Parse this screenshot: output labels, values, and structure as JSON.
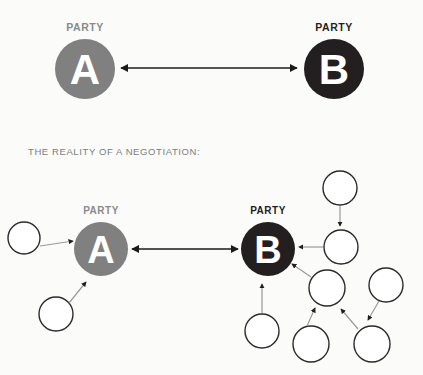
{
  "canvas": {
    "width": 423,
    "height": 375,
    "background": "#fbfbfa"
  },
  "caption": {
    "text": "THE REALITY OF A NEGOTIATION:",
    "color": "#7d7d7d",
    "x": 28,
    "y": 155,
    "font_size": 9.5
  },
  "colors": {
    "party_a_fill": "#808080",
    "party_a_label": "#8a8a8a",
    "party_b_fill": "#231f20",
    "party_b_label": "#231f20",
    "letter_fill": "#ffffff",
    "satellite_fill": "#ffffff",
    "satellite_stroke": "#2b2b2b",
    "arrow_dark": "#1a1a1a",
    "arrow_light": "#8f8f8f"
  },
  "diagram_top": {
    "name": "ideal-negotiation",
    "party_a": {
      "label": "PARTY",
      "letter": "A",
      "cx": 85,
      "cy": 69,
      "r": 30,
      "label_x": 85,
      "label_y": 31,
      "fill": "#808080",
      "label_color": "#8a8a8a"
    },
    "party_b": {
      "label": "PARTY",
      "letter": "B",
      "cx": 334,
      "cy": 69,
      "r": 30,
      "label_x": 334,
      "label_y": 31,
      "fill": "#231f20",
      "label_color": "#231f20"
    },
    "connector": {
      "name": "bidirectional-arrow",
      "x1": 121,
      "x2": 297,
      "y": 68,
      "color": "#1a1a1a"
    }
  },
  "diagram_bottom": {
    "name": "real-negotiation",
    "party_a": {
      "label": "PARTY",
      "letter": "A",
      "cx": 101,
      "cy": 249,
      "r": 27,
      "label_x": 101,
      "label_y": 214,
      "fill": "#808080",
      "label_color": "#8a8a8a"
    },
    "party_b": {
      "label": "PARTY",
      "letter": "B",
      "cx": 268,
      "cy": 249,
      "r": 27,
      "label_x": 268,
      "label_y": 214,
      "fill": "#231f20",
      "label_color": "#231f20"
    },
    "connector": {
      "name": "bidirectional-arrow",
      "x1": 132,
      "x2": 238,
      "y": 249,
      "color": "#1a1a1a"
    },
    "satellites": [
      {
        "id": "a-upper-left",
        "cx": 24,
        "cy": 238,
        "r": 16
      },
      {
        "id": "a-lower-left",
        "cx": 56,
        "cy": 314,
        "r": 17
      },
      {
        "id": "b-top",
        "cx": 340,
        "cy": 188,
        "r": 17
      },
      {
        "id": "b-right",
        "cx": 341,
        "cy": 247,
        "r": 17
      },
      {
        "id": "b-below",
        "cx": 262,
        "cy": 331,
        "r": 17
      },
      {
        "id": "b-mid-right",
        "cx": 327,
        "cy": 288,
        "r": 18
      },
      {
        "id": "b-far-right",
        "cx": 386,
        "cy": 285,
        "r": 17
      },
      {
        "id": "b-bottom-left",
        "cx": 311,
        "cy": 344,
        "r": 18
      },
      {
        "id": "b-bottom-right",
        "cx": 372,
        "cy": 344,
        "r": 18
      }
    ],
    "satellite_arrows": [
      {
        "id": "arrow-a-upper-left",
        "from": "a-upper-left",
        "to": "party-a",
        "x1": 40,
        "y1": 246,
        "x2": 73,
        "y2": 241
      },
      {
        "id": "arrow-a-lower-left",
        "from": "a-lower-left",
        "to": "party-a",
        "x1": 69,
        "y1": 303,
        "x2": 86,
        "y2": 282
      },
      {
        "id": "arrow-b-top-down",
        "from": "b-top",
        "to": "b-right",
        "x1": 340,
        "y1": 206,
        "x2": 340,
        "y2": 226
      },
      {
        "id": "arrow-b-right-in",
        "from": "b-right",
        "to": "party-b",
        "x1": 323,
        "y1": 247,
        "x2": 299,
        "y2": 247
      },
      {
        "id": "arrow-b-below-up",
        "from": "b-below",
        "to": "party-b",
        "x1": 262,
        "y1": 313,
        "x2": 262,
        "y2": 285
      },
      {
        "id": "arrow-b-mid-right-in",
        "from": "b-mid-right",
        "to": "party-b",
        "x1": 311,
        "y1": 277,
        "x2": 292,
        "y2": 264
      },
      {
        "id": "arrow-b-bl-up",
        "from": "b-bottom-left",
        "to": "b-mid-right",
        "x1": 309,
        "y1": 327,
        "x2": 316,
        "y2": 307
      },
      {
        "id": "arrow-b-br-up",
        "from": "b-bottom-right",
        "to": "b-mid-right",
        "x1": 360,
        "y1": 330,
        "x2": 341,
        "y2": 308
      },
      {
        "id": "arrow-b-far-right-dn",
        "from": "b-far-right",
        "to": "b-bottom-right",
        "x1": 379,
        "y1": 301,
        "x2": 367,
        "y2": 320
      }
    ]
  }
}
